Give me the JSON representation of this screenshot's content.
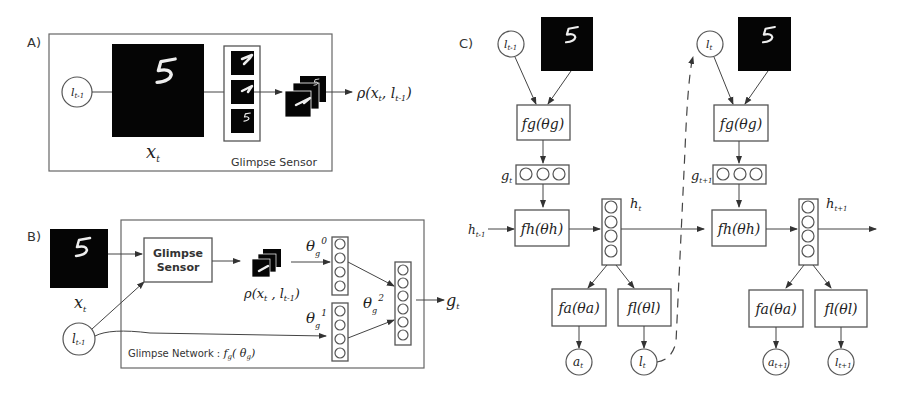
{
  "figure": {
    "panels": [
      {
        "id": "A",
        "label": "A)"
      },
      {
        "id": "B",
        "label": "B)"
      },
      {
        "id": "C",
        "label": "C)"
      }
    ]
  },
  "panelA": {
    "label": "A)",
    "location_node": "l",
    "location_sub": "t-1",
    "image_label": "x",
    "image_sub": "t",
    "sensor_title": "Glimpse Sensor",
    "output_label": "ρ(x",
    "output_sub1": "t",
    "output_mid": ", l",
    "output_sub2": "t-1",
    "output_end": ")"
  },
  "panelB": {
    "label": "B)",
    "image_label": "x",
    "image_sub": "t",
    "location_node": "l",
    "location_sub": "t-1",
    "sensor_box_line1": "Glimpse",
    "sensor_box_line2": "Sensor",
    "glimpse_label": "ρ(x",
    "glimpse_sub1": "t",
    "glimpse_mid": " , l",
    "glimpse_sub2": "t-1",
    "glimpse_end": ")",
    "theta0": "θ",
    "theta0_sub": "g",
    "theta0_sup": "0",
    "theta1": "θ",
    "theta1_sub": "g",
    "theta1_sup": "1",
    "theta2": "θ",
    "theta2_sub": "g",
    "theta2_sup": "2",
    "network_title": "Glimpse Network : ",
    "network_fn": "f",
    "network_fn_sub": "g",
    "network_fn_arg": "( θ",
    "network_fn_arg_sub": "g",
    "network_fn_end": ")",
    "output": "g",
    "output_sub": "t"
  },
  "panelC": {
    "label": "C)",
    "steps": [
      {
        "loc_in": "l",
        "loc_in_sub": "t-1",
        "fg": "fg(θg)",
        "g": "g",
        "g_sub": "t",
        "h_in": "h",
        "h_in_sub": "t-1",
        "fh": "fh(θh)",
        "h": "h",
        "h_sub": "t",
        "fa": "fa(θa)",
        "fl": "fl(θl)",
        "a": "a",
        "a_sub": "t",
        "l": "l",
        "l_sub": "t"
      },
      {
        "loc_in": "l",
        "loc_in_sub": "t",
        "fg": "fg(θg)",
        "g": "g",
        "g_sub": "t+1",
        "fh": "fh(θh)",
        "h": "h",
        "h_sub": "t+1",
        "fa": "fa(θa)",
        "fl": "fl(θl)",
        "a": "a",
        "a_sub": "t+1",
        "l": "l",
        "l_sub": "t+1"
      }
    ]
  },
  "colors": {
    "line": "#444444",
    "image_bg": "#050505",
    "digit": "#eeeeee"
  }
}
